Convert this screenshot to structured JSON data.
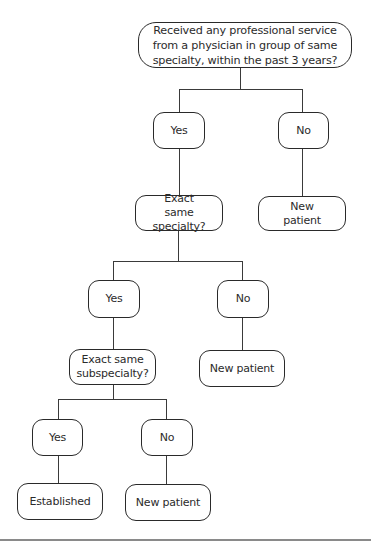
{
  "flowchart": {
    "root": {
      "question": "Received any professional service from a physician in group of same specialty, within the past 3 years?"
    },
    "level1": {
      "yes_label": "Yes",
      "no_label": "No",
      "no_outcome": "New patient",
      "yes_question": "Exact same specialty?"
    },
    "level2": {
      "yes_label": "Yes",
      "no_label": "No",
      "no_outcome": "New patient",
      "yes_question": "Exact same subspecialty?"
    },
    "level3": {
      "yes_label": "Yes",
      "no_label": "No",
      "yes_outcome": "Established",
      "no_outcome": "New patient"
    }
  }
}
